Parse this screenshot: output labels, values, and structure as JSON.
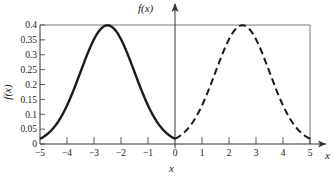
{
  "chart_data": {
    "type": "line",
    "title": "",
    "xlabel": "x",
    "ylabel": "f(x)",
    "top_axis_label": "f(x)",
    "right_axis_label": "x",
    "xlim": [
      -5,
      5
    ],
    "ylim": [
      0,
      0.4
    ],
    "grid": false,
    "legend": null,
    "x_ticks": [
      "−5",
      "−4",
      "−3",
      "−2",
      "−1",
      "0",
      "1",
      "2",
      "3",
      "4",
      "5"
    ],
    "y_ticks": [
      "0",
      "0.05",
      "0.1",
      "0.15",
      "0.2",
      "0.25",
      "0.3",
      "0.35",
      "0.4"
    ],
    "series": [
      {
        "name": "solid",
        "style": "solid",
        "description": "normal density centered at -2.5, sigma 1",
        "mean": -2.5,
        "sd": 1,
        "x": [
          -5,
          -4.5,
          -4,
          -3.5,
          -3,
          -2.5,
          -2,
          -1.5,
          -1,
          -0.5,
          0
        ],
        "values": [
          0.018,
          0.054,
          0.13,
          0.242,
          0.352,
          0.399,
          0.352,
          0.242,
          0.13,
          0.054,
          0.018
        ]
      },
      {
        "name": "dashed",
        "style": "dashed",
        "description": "normal density centered at 2.5, sigma 1",
        "mean": 2.5,
        "sd": 1,
        "x": [
          0,
          0.5,
          1,
          1.5,
          2,
          2.5,
          3,
          3.5,
          4,
          4.5,
          5
        ],
        "values": [
          0.018,
          0.054,
          0.13,
          0.242,
          0.352,
          0.399,
          0.352,
          0.242,
          0.13,
          0.054,
          0.018
        ]
      }
    ]
  }
}
